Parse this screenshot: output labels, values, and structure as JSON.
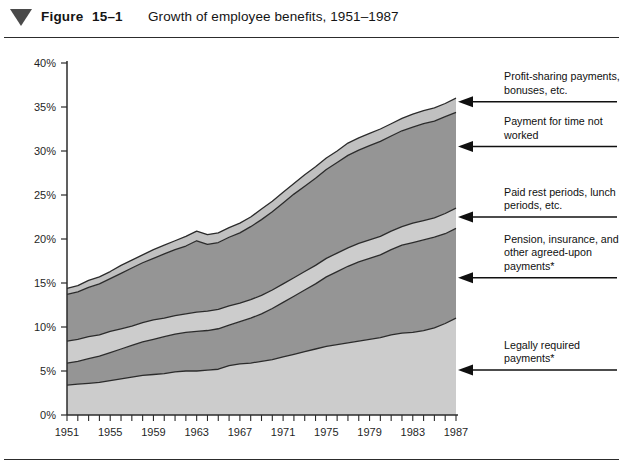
{
  "figure": {
    "marker_icon": "triangle-down-icon",
    "label": "Figure",
    "number": "15–1",
    "title": "Growth of employee benefits, 1951–1987"
  },
  "chart_data": {
    "type": "area",
    "title": "Growth of employee benefits, 1951–1987",
    "subtitle": "",
    "xlabel": "",
    "ylabel": "",
    "stacked": true,
    "grid": false,
    "legend_position": "right-annotations",
    "xlim": [
      1951,
      1987
    ],
    "ylim": [
      0,
      40
    ],
    "ytick_labels": [
      "0%",
      "5%",
      "10%",
      "15%",
      "20%",
      "25%",
      "30%",
      "35%",
      "40%"
    ],
    "ytick_values": [
      0,
      5,
      10,
      15,
      20,
      25,
      30,
      35,
      40
    ],
    "xtick_labels": [
      "1951",
      "1955",
      "1959",
      "1963",
      "1967",
      "1971",
      "1975",
      "1979",
      "1983",
      "1987"
    ],
    "xtick_values": [
      1951,
      1955,
      1959,
      1963,
      1967,
      1971,
      1975,
      1979,
      1983,
      1987
    ],
    "minor_xticks_every": 1,
    "x": [
      1951,
      1952,
      1953,
      1954,
      1955,
      1956,
      1957,
      1958,
      1959,
      1960,
      1961,
      1962,
      1963,
      1964,
      1965,
      1966,
      1967,
      1968,
      1969,
      1970,
      1971,
      1972,
      1973,
      1974,
      1975,
      1976,
      1977,
      1978,
      1979,
      1980,
      1981,
      1982,
      1983,
      1984,
      1985,
      1986,
      1987
    ],
    "series": [
      {
        "name": "Legally required payments*",
        "color": "#cccccc",
        "values": [
          3.4,
          3.5,
          3.6,
          3.7,
          3.9,
          4.1,
          4.3,
          4.5,
          4.6,
          4.7,
          4.9,
          5.0,
          5.0,
          5.1,
          5.2,
          5.6,
          5.8,
          5.9,
          6.1,
          6.3,
          6.6,
          6.9,
          7.2,
          7.5,
          7.8,
          8.0,
          8.2,
          8.4,
          8.6,
          8.8,
          9.1,
          9.3,
          9.4,
          9.6,
          9.9,
          10.4,
          11.0
        ]
      },
      {
        "name": "Pension, insurance, and other agreed-upon payments*",
        "color": "#959595",
        "values": [
          2.5,
          2.6,
          2.8,
          3.0,
          3.2,
          3.4,
          3.6,
          3.8,
          4.0,
          4.2,
          4.3,
          4.4,
          4.5,
          4.5,
          4.6,
          4.6,
          4.8,
          5.1,
          5.4,
          5.8,
          6.2,
          6.6,
          7.0,
          7.4,
          7.9,
          8.3,
          8.7,
          9.0,
          9.2,
          9.4,
          9.7,
          10.0,
          10.2,
          10.3,
          10.3,
          10.2,
          10.2
        ]
      },
      {
        "name": "Paid rest periods, lunch periods, etc.",
        "color": "#cccccc",
        "values": [
          2.5,
          2.5,
          2.5,
          2.4,
          2.4,
          2.3,
          2.2,
          2.2,
          2.2,
          2.1,
          2.1,
          2.1,
          2.2,
          2.2,
          2.2,
          2.2,
          2.1,
          2.1,
          2.1,
          2.1,
          2.1,
          2.1,
          2.1,
          2.1,
          2.1,
          2.1,
          2.1,
          2.1,
          2.1,
          2.1,
          2.1,
          2.1,
          2.2,
          2.2,
          2.2,
          2.3,
          2.3
        ]
      },
      {
        "name": "Payment for time not worked",
        "color": "#959595",
        "values": [
          5.3,
          5.4,
          5.6,
          5.8,
          6.0,
          6.3,
          6.6,
          6.8,
          7.0,
          7.3,
          7.5,
          7.7,
          8.1,
          7.6,
          7.6,
          7.8,
          8.0,
          8.3,
          8.6,
          8.9,
          9.2,
          9.5,
          9.7,
          9.9,
          10.1,
          10.3,
          10.5,
          10.6,
          10.7,
          10.8,
          10.8,
          10.9,
          10.9,
          11.0,
          11.0,
          11.0,
          10.9
        ]
      },
      {
        "name": "Profit-sharing payments, bonuses, etc.",
        "color": "#c0c0c0",
        "values": [
          0.7,
          0.7,
          0.8,
          0.8,
          0.8,
          0.9,
          0.9,
          0.9,
          1.0,
          1.0,
          1.0,
          1.1,
          1.1,
          1.1,
          1.1,
          1.1,
          1.1,
          1.1,
          1.2,
          1.2,
          1.2,
          1.2,
          1.3,
          1.3,
          1.3,
          1.3,
          1.4,
          1.4,
          1.4,
          1.4,
          1.4,
          1.4,
          1.5,
          1.5,
          1.5,
          1.5,
          1.6
        ]
      }
    ],
    "cumulative_tops": {
      "1951": [
        3.4,
        5.9,
        8.4,
        13.7,
        14.4
      ],
      "1963": [
        5.0,
        9.5,
        11.7,
        19.8,
        20.9
      ],
      "1975": [
        7.8,
        15.7,
        17.8,
        27.9,
        29.2
      ],
      "1987": [
        11.0,
        21.2,
        23.5,
        34.4,
        36.0
      ]
    },
    "annotations": [
      {
        "name": "Profit-sharing payments, bonuses, etc.",
        "lines": [
          "Profit-sharing payments,",
          "bonuses, etc."
        ],
        "arrow_target_percent": 35.6
      },
      {
        "name": "Payment for time not worked",
        "lines": [
          "Payment for time not",
          "worked"
        ],
        "arrow_target_percent": 30.5
      },
      {
        "name": "Paid rest periods, lunch periods, etc.",
        "lines": [
          "Paid rest periods, lunch",
          "periods, etc."
        ],
        "arrow_target_percent": 22.5
      },
      {
        "name": "Pension, insurance, and other agreed-upon payments*",
        "lines": [
          "Pension, insurance, and",
          "other agreed-upon",
          "payments*"
        ],
        "arrow_target_percent": 15.6
      },
      {
        "name": "Legally required payments*",
        "lines": [
          "Legally required",
          "payments*"
        ],
        "arrow_target_percent": 5.1
      }
    ]
  }
}
